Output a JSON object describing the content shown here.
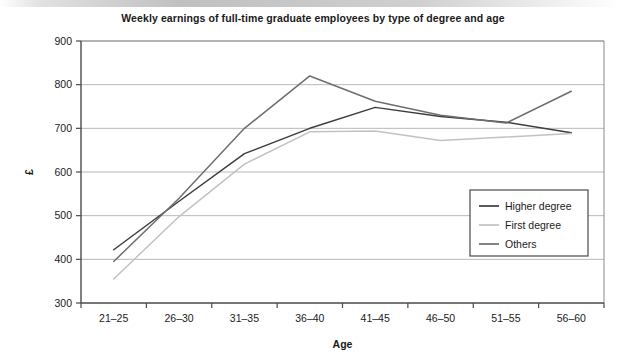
{
  "chart_data": {
    "type": "line",
    "title": "Weekly earnings of full-time graduate employees by type of degree and age",
    "xlabel": "Age",
    "ylabel": "£",
    "categories": [
      "21–25",
      "26–30",
      "31–35",
      "36–40",
      "41–45",
      "46–50",
      "51–55",
      "56–60"
    ],
    "ylim": [
      300,
      900
    ],
    "yticks": [
      300,
      400,
      500,
      600,
      700,
      800,
      900
    ],
    "ytick_labels": [
      "300",
      "400",
      "500",
      "600",
      "700",
      "800",
      "900"
    ],
    "grid": "horizontal",
    "legend_position": "center-right",
    "series": [
      {
        "name": "Higher degree",
        "color": "#3d3d3d",
        "values": [
          422,
          533,
          642,
          700,
          748,
          727,
          714,
          690
        ]
      },
      {
        "name": "First degree",
        "color": "#c2c2c2",
        "values": [
          355,
          498,
          618,
          692,
          694,
          672,
          680,
          688
        ]
      },
      {
        "name": "Others",
        "color": "#6e6e6e",
        "values": [
          395,
          540,
          700,
          820,
          762,
          730,
          712,
          785
        ]
      }
    ]
  },
  "legend": {
    "entries": [
      {
        "label": "Higher degree"
      },
      {
        "label": "First degree"
      },
      {
        "label": "Others"
      }
    ]
  }
}
